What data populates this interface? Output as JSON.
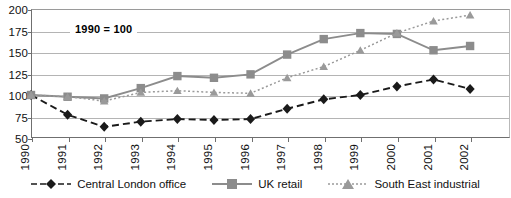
{
  "annotation": {
    "text": "1990 = 100"
  },
  "chart_data": {
    "type": "line",
    "title": "",
    "xlabel": "",
    "ylabel": "",
    "ylim": [
      50,
      200
    ],
    "yticks": [
      200,
      175,
      150,
      125,
      100,
      75,
      50
    ],
    "grid": true,
    "legend_position": "bottom",
    "annotations": [
      "1990 = 100"
    ],
    "categories": [
      "1990",
      "1991",
      "1992",
      "1993",
      "1994",
      "1995",
      "1996",
      "1997",
      "1998",
      "1999",
      "2000",
      "2001",
      "2002"
    ],
    "series": [
      {
        "name": "Central London office",
        "marker": "diamond",
        "linestyle": "dashed",
        "color": "#1a1a1a",
        "values": [
          100,
          77,
          63,
          69,
          72,
          71,
          72,
          84,
          95,
          100,
          110,
          118,
          107
        ]
      },
      {
        "name": "UK retail",
        "marker": "square",
        "linestyle": "solid",
        "color": "#8c8c8c",
        "values": [
          100,
          98,
          96,
          108,
          122,
          120,
          124,
          147,
          165,
          172,
          171,
          152,
          157
        ]
      },
      {
        "name": "South East industrial",
        "marker": "triangle",
        "linestyle": "dotted",
        "color": "#9a9a9a",
        "values": [
          100,
          98,
          93,
          103,
          105,
          103,
          102,
          120,
          133,
          152,
          172,
          186,
          193
        ]
      }
    ]
  },
  "legend": {
    "items": [
      {
        "label": "Central London office"
      },
      {
        "label": "UK retail"
      },
      {
        "label": "South East industrial"
      }
    ]
  }
}
